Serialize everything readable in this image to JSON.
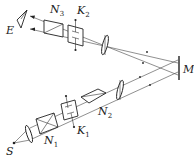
{
  "diagram": {
    "colors": {
      "line": "#222222",
      "background": "#ffffff"
    },
    "labels": {
      "eye": "E",
      "source": "S",
      "mirror": "M",
      "nicol3": {
        "main": "N",
        "sub": "3"
      },
      "kerr2": {
        "main": "K",
        "sub": "2"
      },
      "nicol2": {
        "main": "N",
        "sub": "2"
      },
      "kerr1": {
        "main": "K",
        "sub": "1"
      },
      "nicol1": {
        "main": "N",
        "sub": "1"
      }
    },
    "components": [
      {
        "id": "S",
        "type": "point-source"
      },
      {
        "id": "lens-source",
        "type": "lens"
      },
      {
        "id": "N1",
        "type": "nicol-prism"
      },
      {
        "id": "K1",
        "type": "kerr-cell"
      },
      {
        "id": "N2",
        "type": "nicol-prism"
      },
      {
        "id": "lens-lower",
        "type": "lens"
      },
      {
        "id": "M",
        "type": "mirror"
      },
      {
        "id": "lens-upper",
        "type": "lens"
      },
      {
        "id": "K2",
        "type": "kerr-cell"
      },
      {
        "id": "N3",
        "type": "nicol-prism"
      },
      {
        "id": "E",
        "type": "eye"
      }
    ]
  }
}
